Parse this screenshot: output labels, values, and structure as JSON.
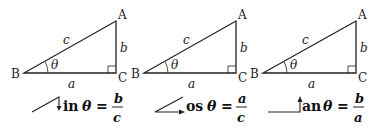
{
  "diagrams": [
    {
      "vertices": {
        "A": "A",
        "B": "B",
        "C": "C"
      },
      "sides": {
        "hyp": "c",
        "opp": "b",
        "adj": "a"
      },
      "angle": "θ",
      "formula": {
        "fn_tail": "in",
        "theta": "θ",
        "equals": "=",
        "num": "b",
        "den": "c",
        "fn_name": "sin"
      }
    },
    {
      "vertices": {
        "A": "A",
        "B": "B",
        "C": "C"
      },
      "sides": {
        "hyp": "c",
        "opp": "b",
        "adj": "a"
      },
      "angle": "θ",
      "formula": {
        "fn_tail": "os",
        "theta": "θ",
        "equals": "=",
        "num": "a",
        "den": "c",
        "fn_name": "cos"
      }
    },
    {
      "vertices": {
        "A": "A",
        "B": "B",
        "C": "C"
      },
      "sides": {
        "hyp": "c",
        "opp": "b",
        "adj": "a"
      },
      "angle": "θ",
      "formula": {
        "fn_tail": "an",
        "theta": "θ",
        "equals": "=",
        "num": "b",
        "den": "a",
        "fn_name": "tan"
      }
    }
  ]
}
